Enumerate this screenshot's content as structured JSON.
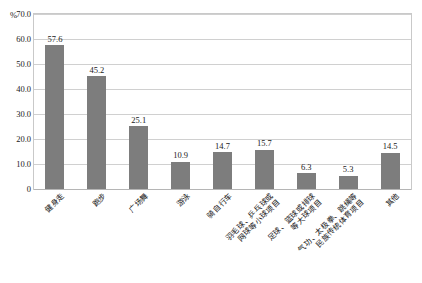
{
  "chart_data": {
    "type": "bar",
    "title": "",
    "subtitle": "",
    "xlabel": "",
    "ylabel": "%",
    "unit_label": "%",
    "ylim": [
      0,
      70
    ],
    "grid": true,
    "legend": "none",
    "orientation": "vertical",
    "bar_color": "#7d7d7d",
    "frame_color": "#c9c9c9",
    "gridline_color": "#d0d0d0",
    "y_ticks": [
      "70.0",
      "60.0",
      "50.0",
      "40.0",
      "30.0",
      "20.0",
      "10.0",
      "0"
    ],
    "y_tick_values": [
      70.0,
      60.0,
      50.0,
      40.0,
      30.0,
      20.0,
      10.0,
      0
    ],
    "categories": [
      "健身走",
      "跑步",
      "广场舞",
      "游泳",
      "骑自行车",
      "羽毛球、乒乓球或网球等小球项目",
      "足球、篮球或排球等大球项目",
      "气功、太极拳、跳绳等民族传统体育项目",
      "其他"
    ],
    "category_lines": [
      [
        "健身走"
      ],
      [
        "跑步"
      ],
      [
        "广场舞"
      ],
      [
        "游泳"
      ],
      [
        "骑自行车"
      ],
      [
        "羽毛球、乒乓球或",
        "网球等小球项目"
      ],
      [
        "足球、篮球或排球",
        "等大球项目"
      ],
      [
        "气功、太极拳、跳绳等",
        "民族传统体育项目"
      ],
      [
        "其他"
      ]
    ],
    "values": [
      57.6,
      45.2,
      25.1,
      10.9,
      14.7,
      15.7,
      6.3,
      5.3,
      14.5
    ],
    "value_labels": [
      "57.6",
      "45.2",
      "25.1",
      "10.9",
      "14.7",
      "15.7",
      "6.3",
      "5.3",
      "14.5"
    ]
  }
}
